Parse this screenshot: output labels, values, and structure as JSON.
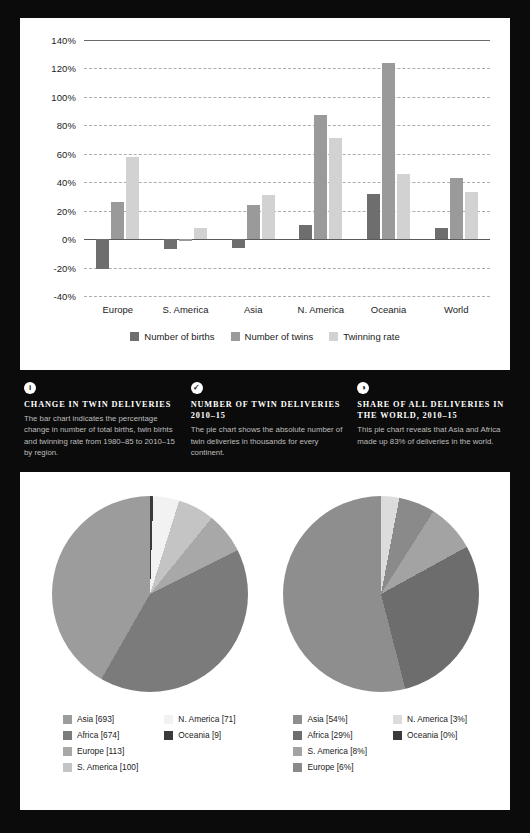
{
  "bar_panel": {
    "legend": [
      {
        "label": "Number of births",
        "color": "#6e6e6e"
      },
      {
        "label": "Number of twins",
        "color": "#9a9a9a"
      },
      {
        "label": "Twinning rate",
        "color": "#d2d2d2"
      }
    ]
  },
  "captions": [
    {
      "icon": "info-icon",
      "glyph": "i",
      "title": "Change in twin deliveries",
      "body": "The bar chart indicates the percentage change in number of total births, twin birhts and twinning rate from 1980–85 to 2010–15 by region."
    },
    {
      "icon": "check-icon",
      "glyph": "✓",
      "title": "Number of twin deliveries 2010–15",
      "body": "The pie chart shows the absolute number of twin deliveries in thousands for every continent."
    },
    {
      "icon": "globe-icon",
      "glyph": "◑",
      "title": "Share of all deliveries in the world, 2010–15",
      "body": "This pie chart reveals that Asia and Africa made up 83% of deliveries in the world."
    }
  ],
  "chart_data": [
    {
      "type": "bar",
      "title": "Change in twin deliveries",
      "xlabel": "",
      "ylabel": "",
      "categories": [
        "Europe",
        "S. America",
        "Asia",
        "N. America",
        "Oceania",
        "World"
      ],
      "series": [
        {
          "name": "Number of births",
          "color": "#6e6e6e",
          "values": [
            -21,
            -7,
            -6,
            10,
            32,
            8
          ]
        },
        {
          "name": "Number of twins",
          "color": "#9a9a9a",
          "values": [
            26,
            -1,
            24,
            87,
            124,
            43
          ]
        },
        {
          "name": "Twinning rate",
          "color": "#d2d2d2",
          "values": [
            58,
            8,
            31,
            71,
            46,
            33
          ]
        }
      ],
      "ylim": [
        -40,
        140
      ],
      "yticks": [
        140,
        120,
        100,
        80,
        60,
        40,
        20,
        0,
        -20,
        -40
      ],
      "ytick_labels": [
        "140%",
        "120%",
        "100%",
        "80%",
        "60%",
        "40%",
        "20%",
        "0%",
        "-20%",
        "-40%"
      ],
      "grid": true,
      "legend_position": "bottom"
    },
    {
      "type": "pie",
      "title": "Number of twin deliveries 2010–15",
      "unit": "thousands",
      "labels": [
        "Asia",
        "Africa",
        "Europe",
        "S. America",
        "N. America",
        "Oceania"
      ],
      "values": [
        693,
        674,
        113,
        100,
        71,
        9
      ],
      "legend": [
        {
          "label": "Asia [693]",
          "color": "#9c9c9c"
        },
        {
          "label": "Africa [674]",
          "color": "#7b7b7b"
        },
        {
          "label": "Europe [113]",
          "color": "#a8a8a8"
        },
        {
          "label": "S. America [100]",
          "color": "#c4c4c4"
        },
        {
          "label": "N. America [71]",
          "color": "#f2f2f2"
        },
        {
          "label": "Oceania [9]",
          "color": "#3a3a3a"
        }
      ],
      "legend_position": "bottom"
    },
    {
      "type": "pie",
      "title": "Share of all deliveries in the world, 2010–15",
      "unit": "percent",
      "labels": [
        "Asia",
        "Africa",
        "S. America",
        "Europe",
        "N. America",
        "Oceania"
      ],
      "values": [
        54,
        29,
        8,
        6,
        3,
        0
      ],
      "legend": [
        {
          "label": "Asia [54%]",
          "color": "#8e8e8e"
        },
        {
          "label": "Africa [29%]",
          "color": "#6d6d6d"
        },
        {
          "label": "S. America [8%]",
          "color": "#a3a3a3"
        },
        {
          "label": "Europe [6%]",
          "color": "#8a8a8a"
        },
        {
          "label": "N. America [3%]",
          "color": "#dcdcdc"
        },
        {
          "label": "Oceania [0%]",
          "color": "#3a3a3a"
        }
      ],
      "legend_position": "bottom"
    }
  ]
}
